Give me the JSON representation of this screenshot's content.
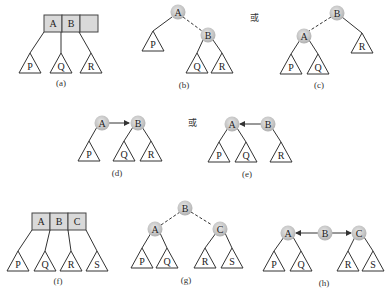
{
  "figure": {
    "or_label": "或",
    "panels": [
      {
        "id": "a",
        "caption": "(a)",
        "type": "3-node",
        "keys": [
          "A",
          "B",
          ""
        ],
        "subtrees": [
          "P",
          "Q",
          "R"
        ]
      },
      {
        "id": "b",
        "caption": "(b)",
        "type": "red-black",
        "root": "A",
        "red_child": "B",
        "subtrees": [
          "P",
          "Q",
          "R"
        ]
      },
      {
        "id": "c",
        "caption": "(c)",
        "type": "red-black",
        "root": "B",
        "red_child": "A",
        "subtrees": [
          "P",
          "Q",
          "R"
        ]
      },
      {
        "id": "d",
        "caption": "(d)",
        "type": "threaded",
        "nodes": [
          "A",
          "B"
        ],
        "arrow": "A→B",
        "subtrees": [
          "P",
          "Q",
          "R"
        ]
      },
      {
        "id": "e",
        "caption": "(e)",
        "type": "threaded",
        "nodes": [
          "A",
          "B"
        ],
        "arrow": "B→A",
        "subtrees": [
          "P",
          "Q",
          "R"
        ]
      },
      {
        "id": "f",
        "caption": "(f)",
        "type": "4-node",
        "keys": [
          "A",
          "B",
          "C"
        ],
        "subtrees": [
          "P",
          "Q",
          "R",
          "S"
        ]
      },
      {
        "id": "g",
        "caption": "(g)",
        "type": "red-black",
        "root": "B",
        "red_children": [
          "A",
          "C"
        ],
        "subtrees": [
          "P",
          "Q",
          "R",
          "S"
        ]
      },
      {
        "id": "h",
        "caption": "(h)",
        "type": "threaded",
        "nodes": [
          "A",
          "B",
          "C"
        ],
        "arrows": [
          "B→A",
          "B→C"
        ],
        "subtrees": [
          "P",
          "Q",
          "R",
          "S"
        ]
      }
    ]
  },
  "colors": {
    "node_fill": "#c8c8c8",
    "node_highlight": "#e6e6e6",
    "cell_fill": "#d9d9d9",
    "stroke": "#333333"
  },
  "labels": {
    "A": "A",
    "B": "B",
    "C": "C",
    "P": "P",
    "Q": "Q",
    "R": "R",
    "S": "S"
  }
}
